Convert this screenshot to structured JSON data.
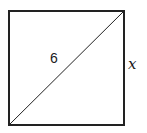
{
  "diagram": {
    "shape": "square",
    "diagonal_label": "6",
    "side_label": "x",
    "stroke_color": "#222222",
    "background": "#ffffff"
  }
}
